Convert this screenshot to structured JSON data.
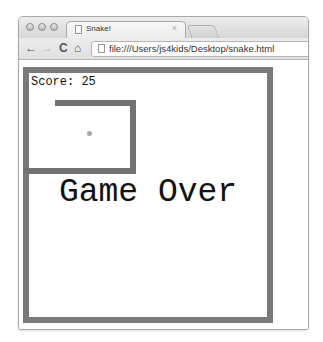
{
  "browser": {
    "tab": {
      "title": "Snake!",
      "close_glyph": "×"
    },
    "nav": {
      "back": "←",
      "forward": "→",
      "reload": "C",
      "home": "⌂"
    },
    "url": "file:///Users/js4kids/Desktop/snake.html"
  },
  "game": {
    "score_text": "Score: 25",
    "game_over_text": "Game Over",
    "colors": {
      "wall": "#7a7a7a",
      "snake": "#717171",
      "apple": "#a8a8a8"
    }
  }
}
